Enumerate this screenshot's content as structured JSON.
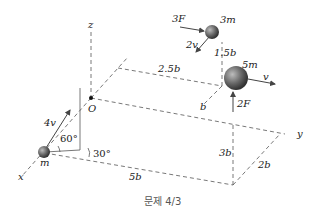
{
  "diagram": {
    "axes": {
      "x": "x",
      "y": "y",
      "z": "z",
      "origin": "O"
    },
    "masses": [
      {
        "id": "m",
        "label": "m",
        "velocity": "4v",
        "angle_elev": "60°",
        "angle_horiz": "30°"
      },
      {
        "id": "3m",
        "label": "3m",
        "velocity": "2v",
        "force": "3F",
        "height": "1.5b"
      },
      {
        "id": "5m",
        "label": "5m",
        "velocity": "v",
        "force": "2F"
      }
    ],
    "dimensions": {
      "d_2_5b": "2.5b",
      "d_b": "b",
      "d_3b": "3b",
      "d_2b": "2b",
      "d_5b": "5b"
    },
    "caption": "문제 4/3"
  }
}
